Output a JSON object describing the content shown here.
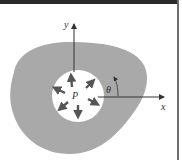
{
  "diagram": {
    "labels": {
      "y_axis": "y",
      "x_axis": "x",
      "angle": "θ",
      "point": "P"
    },
    "colors": {
      "body_fill": "#a9a9a9",
      "hole_fill": "#ffffff",
      "axis": "#333333",
      "arrow": "#555555",
      "frame_top": "#2a2a2a",
      "frame_right": "#6e6e6e"
    },
    "elements": {
      "body": "gray irregular region",
      "hole": "circular hole with internal pressure P",
      "pressure_arrows": 8
    }
  }
}
